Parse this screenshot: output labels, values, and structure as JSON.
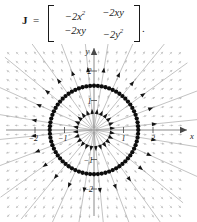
{
  "formula": {
    "symbol": "J",
    "equals": "=",
    "matrix": [
      [
        "−2x²",
        "−2xy"
      ],
      [
        "−2xy",
        "−2y²"
      ]
    ],
    "m00": "−2x",
    "m00sup": "2",
    "m01": "−2xy",
    "m10": "−2xy",
    "m11": "−2y",
    "m11sup": "2",
    "trailing_punct": "."
  },
  "chart_data": {
    "type": "scatter",
    "title": "",
    "subtitle": "",
    "xlabel": "x",
    "ylabel": "y",
    "xlim": [
      -2.75,
      2.75
    ],
    "ylim": [
      -2.75,
      2.75
    ],
    "grid": false,
    "legend": "none",
    "x_ticks": [
      -2,
      -1,
      1,
      2
    ],
    "x_tick_labels": [
      "−2",
      "−1",
      "1",
      "2"
    ],
    "y_ticks": [
      -2,
      -1,
      1,
      2
    ],
    "y_tick_labels": [
      "−2",
      "−1",
      "1",
      "2"
    ],
    "limit_cycle": {
      "shape": "circle",
      "center": [
        0,
        0
      ],
      "radius": 1.5,
      "marker": "filled-circle-dots",
      "dot_count": 72,
      "color": "#0d0d0d"
    },
    "equilibrium": {
      "point": [
        0,
        0
      ],
      "type": "unstable-node",
      "label": ""
    },
    "trajectories": {
      "kind": "radial-rays",
      "count": 24,
      "direction": "outward",
      "arrowheads_per_ray": 2,
      "inner_radius": 0.06,
      "outer_radius": 3.9,
      "color": "#9a9a9a",
      "arrow_color": "#141414"
    },
    "vector_field": {
      "kind": "radial-outward-grid",
      "grid_spacing": 0.3,
      "color": "#c9c9c9",
      "note": "small grey arrows on a regular lattice, each pointing radially away from the origin"
    }
  },
  "colors": {
    "background": "#ffffff",
    "axis": "#8a8a8a",
    "cycle": "#0d0d0d",
    "trajectory": "#9a9a9a",
    "field": "#c9c9c9",
    "text": "#1a1a1a"
  }
}
